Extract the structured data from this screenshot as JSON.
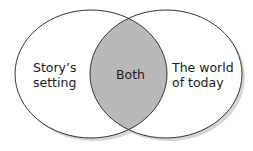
{
  "diagram": {
    "type": "venn",
    "sets": [
      {
        "id": "left",
        "label_lines": [
          "Story’s",
          "setting"
        ]
      },
      {
        "id": "right",
        "label_lines": [
          "The world",
          "of today"
        ]
      }
    ],
    "intersection": {
      "label": "Both"
    },
    "colors": {
      "outline": "#333333",
      "circle_fill": "#ffffff",
      "intersection_fill": "#b9b9b9",
      "shadow": "#cfcfcf"
    }
  }
}
